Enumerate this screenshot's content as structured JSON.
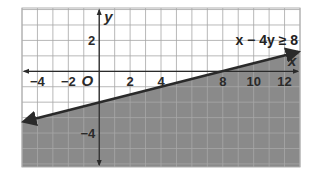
{
  "chart_data": {
    "type": "area",
    "title": "",
    "xlabel": "x",
    "ylabel": "y",
    "xlim": [
      -5,
      13
    ],
    "ylim": [
      -6.2,
      4.1
    ],
    "grid": true,
    "grid_step": 1,
    "x_ticks": [
      -4,
      -2,
      2,
      4,
      8,
      10,
      12
    ],
    "x_tick_labels": [
      "−4",
      "−2",
      "2",
      "4",
      "8",
      "10",
      "12"
    ],
    "y_ticks": [
      2,
      -4
    ],
    "y_tick_labels": [
      "2",
      "−4"
    ],
    "origin_label": "O",
    "inequality": "x − 4y ≥ 8",
    "boundary_line": {
      "equation": "y = (x - 8) / 4",
      "style": "solid",
      "points": [
        [
          -5,
          -3.25
        ],
        [
          13,
          1.25
        ]
      ],
      "x_intercept": 8,
      "y_intercept": -2
    },
    "shaded_region": "below",
    "colors": {
      "shade": "#8a8a8a",
      "grid_light": "#c8c8c8",
      "grid_dark": "#a8a8a8",
      "line": "#2a2a2a"
    }
  }
}
